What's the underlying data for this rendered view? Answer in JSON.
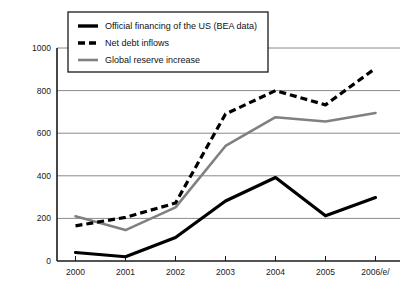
{
  "chart_data": {
    "type": "line",
    "title": "",
    "subtitle": "",
    "xlabel": "",
    "ylabel": "",
    "categories": [
      "2000",
      "2001",
      "2002",
      "2003",
      "2004",
      "2005",
      "2006/e/"
    ],
    "x_tick_labels": [
      "2000",
      "2001",
      "2002",
      "2003",
      "2004",
      "2005",
      "2006/e/"
    ],
    "y_tick_labels": [
      "0",
      "200",
      "400",
      "600",
      "800",
      "1000"
    ],
    "y_ticks": [
      0,
      200,
      400,
      600,
      800,
      1000
    ],
    "ylim": [
      0,
      1000
    ],
    "grid": "horizontal",
    "legend_position": "top-left-inside",
    "series": [
      {
        "name": "Official financing of the US (BEA data)",
        "style": "solid",
        "color": "#000000",
        "width": 3.2,
        "values": [
          40,
          20,
          110,
          282,
          392,
          212,
          298
        ]
      },
      {
        "name": "Net debt inflows",
        "style": "dashed",
        "color": "#000000",
        "width": 3.2,
        "values": [
          165,
          205,
          272,
          690,
          800,
          733,
          905
        ]
      },
      {
        "name": "Global reserve increase",
        "style": "solid",
        "color": "#808080",
        "width": 2.6,
        "values": [
          210,
          145,
          252,
          540,
          675,
          655,
          695
        ]
      }
    ]
  },
  "legend": {
    "entries": [
      {
        "label": "Official financing of the US (BEA data)",
        "swatch": "solid-black-line-swatch"
      },
      {
        "label": "Net debt inflows",
        "swatch": "dashed-black-line-swatch"
      },
      {
        "label": "Global reserve increase",
        "swatch": "solid-gray-line-swatch"
      }
    ]
  },
  "colors": {
    "series_solid": "#000000",
    "series_dashed": "#000000",
    "series_gray": "#808080",
    "grid": "#8a8a8a",
    "axis": "#1a1a1a",
    "background": "#ffffff"
  }
}
